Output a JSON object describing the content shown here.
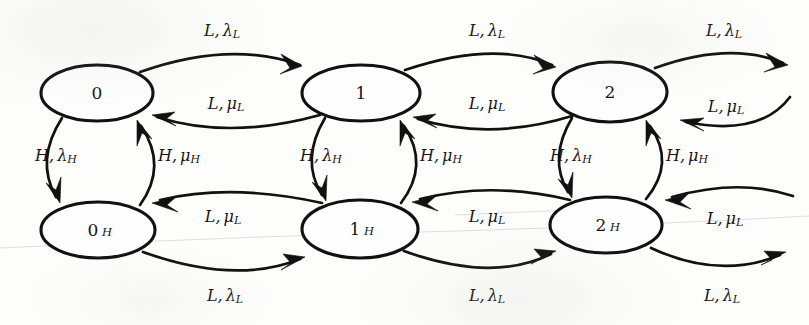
{
  "figure": {
    "type": "state-transition-diagram",
    "background_color": "#fdfdfb",
    "ink_color": "#111111"
  },
  "nodes": [
    {
      "id": "s0",
      "base": "0",
      "sub": "",
      "cx": 97,
      "cy": 93,
      "rx": 56,
      "ry": 28
    },
    {
      "id": "s1",
      "base": "1",
      "sub": "",
      "cx": 361,
      "cy": 93,
      "rx": 59,
      "ry": 28
    },
    {
      "id": "s2",
      "base": "2",
      "sub": "",
      "cx": 610,
      "cy": 92,
      "rx": 57,
      "ry": 30
    },
    {
      "id": "s0h",
      "base": "0",
      "sub": "H",
      "cx": 98,
      "cy": 230,
      "rx": 57,
      "ry": 28
    },
    {
      "id": "s1h",
      "base": "1",
      "sub": "H",
      "cx": 360,
      "cy": 229,
      "rx": 58,
      "ry": 29
    },
    {
      "id": "s2h",
      "base": "2",
      "sub": "H",
      "cx": 606,
      "cy": 225,
      "rx": 56,
      "ry": 28
    }
  ],
  "labels": [
    {
      "id": "lbl-top-1",
      "event": "L",
      "comma": ",",
      "rate": "λ",
      "sub": "L",
      "x": 222,
      "y": 31
    },
    {
      "id": "lbl-top-2",
      "event": "L",
      "comma": ",",
      "rate": "λ",
      "sub": "L",
      "x": 487,
      "y": 31
    },
    {
      "id": "lbl-top-3",
      "event": "L",
      "comma": ",",
      "rate": "λ",
      "sub": "L",
      "x": 724,
      "y": 31
    },
    {
      "id": "lbl-mid-1",
      "event": "L",
      "comma": ",",
      "rate": "μ",
      "sub": "L",
      "x": 226,
      "y": 104
    },
    {
      "id": "lbl-mid-2",
      "event": "L",
      "comma": ",",
      "rate": "μ",
      "sub": "L",
      "x": 487,
      "y": 104
    },
    {
      "id": "lbl-mid-3",
      "event": "L",
      "comma": ",",
      "rate": "μ",
      "sub": "L",
      "x": 726,
      "y": 107
    },
    {
      "id": "lbl-v-0-down",
      "event": "H",
      "comma": ",",
      "rate": "λ",
      "sub": "H",
      "x": 56,
      "y": 156
    },
    {
      "id": "lbl-v-0-up",
      "event": "H",
      "comma": ",",
      "rate": "μ",
      "sub": "H",
      "x": 179,
      "y": 156
    },
    {
      "id": "lbl-v-1-down",
      "event": "H",
      "comma": ",",
      "rate": "λ",
      "sub": "H",
      "x": 321,
      "y": 156
    },
    {
      "id": "lbl-v-1-up",
      "event": "H",
      "comma": ",",
      "rate": "μ",
      "sub": "H",
      "x": 441,
      "y": 156
    },
    {
      "id": "lbl-v-2-down",
      "event": "H",
      "comma": ",",
      "rate": "λ",
      "sub": "H",
      "x": 571,
      "y": 156
    },
    {
      "id": "lbl-v-2-up",
      "event": "H",
      "comma": ",",
      "rate": "μ",
      "sub": "H",
      "x": 687,
      "y": 156
    },
    {
      "id": "lbl-bmid-1",
      "event": "L",
      "comma": ",",
      "rate": "μ",
      "sub": "L",
      "x": 223,
      "y": 217
    },
    {
      "id": "lbl-bmid-2",
      "event": "L",
      "comma": ",",
      "rate": "μ",
      "sub": "L",
      "x": 487,
      "y": 217
    },
    {
      "id": "lbl-bmid-3",
      "event": "L",
      "comma": ",",
      "rate": "μ",
      "sub": "L",
      "x": 725,
      "y": 219
    },
    {
      "id": "lbl-bot-1",
      "event": "L",
      "comma": ",",
      "rate": "λ",
      "sub": "L",
      "x": 225,
      "y": 296
    },
    {
      "id": "lbl-bot-2",
      "event": "L",
      "comma": ",",
      "rate": "λ",
      "sub": "L",
      "x": 487,
      "y": 296
    },
    {
      "id": "lbl-bot-3",
      "event": "L",
      "comma": ",",
      "rate": "λ",
      "sub": "L",
      "x": 722,
      "y": 296
    }
  ],
  "transitions": [
    {
      "from": "0",
      "to": "1",
      "event": "L",
      "rate": "lambda_L"
    },
    {
      "from": "1",
      "to": "0",
      "event": "L",
      "rate": "mu_L"
    },
    {
      "from": "1",
      "to": "2",
      "event": "L",
      "rate": "lambda_L"
    },
    {
      "from": "2",
      "to": "1",
      "event": "L",
      "rate": "mu_L"
    },
    {
      "from": "2",
      "to": "3",
      "event": "L",
      "rate": "lambda_L"
    },
    {
      "from": "3",
      "to": "2",
      "event": "L",
      "rate": "mu_L"
    },
    {
      "from": "0",
      "to": "0_H",
      "event": "H",
      "rate": "lambda_H"
    },
    {
      "from": "0_H",
      "to": "0",
      "event": "H",
      "rate": "mu_H"
    },
    {
      "from": "1",
      "to": "1_H",
      "event": "H",
      "rate": "lambda_H"
    },
    {
      "from": "1_H",
      "to": "1",
      "event": "H",
      "rate": "mu_H"
    },
    {
      "from": "2",
      "to": "2_H",
      "event": "H",
      "rate": "lambda_H"
    },
    {
      "from": "2_H",
      "to": "2",
      "event": "H",
      "rate": "mu_H"
    },
    {
      "from": "0_H",
      "to": "1_H",
      "event": "L",
      "rate": "lambda_L"
    },
    {
      "from": "1_H",
      "to": "0_H",
      "event": "L",
      "rate": "mu_L"
    },
    {
      "from": "1_H",
      "to": "2_H",
      "event": "L",
      "rate": "lambda_L"
    },
    {
      "from": "2_H",
      "to": "1_H",
      "event": "L",
      "rate": "mu_L"
    },
    {
      "from": "2_H",
      "to": "3_H",
      "event": "L",
      "rate": "lambda_L"
    },
    {
      "from": "3_H",
      "to": "2_H",
      "event": "L",
      "rate": "mu_L"
    }
  ]
}
